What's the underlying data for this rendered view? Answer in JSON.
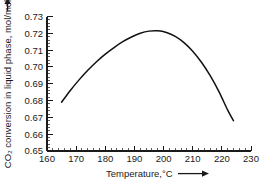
{
  "chart_data": {
    "type": "line",
    "title": "",
    "subtitle": "",
    "xlabel": "Temperature,°C",
    "xlabel_arrow": "⟶",
    "ylabel": "CO₂ conversion in liquid phase, mol/mol",
    "ylabel_arrow": "⟶",
    "xlim": [
      160,
      230
    ],
    "ylim": [
      0.65,
      0.73
    ],
    "xticks": [
      160,
      170,
      180,
      190,
      200,
      210,
      220,
      230
    ],
    "xtick_labels": [
      "160",
      "170",
      "180",
      "190",
      "200",
      "210",
      "220",
      "230"
    ],
    "yticks": [
      0.65,
      0.66,
      0.67,
      0.68,
      0.69,
      0.7,
      0.71,
      0.72,
      0.73
    ],
    "ytick_labels": [
      "0.65",
      "0.66",
      "0.67",
      "0.68",
      "0.69",
      "0.70",
      "0.71",
      "0.72",
      "0.73"
    ],
    "x_minor_per_major": 5,
    "y_minor_per_major": 5,
    "grid": false,
    "legend": false,
    "legend_position": "none",
    "tick_direction": "in",
    "spines": [
      "left",
      "bottom"
    ],
    "line_color": "#111111",
    "background_color": "#ffffff",
    "series": [
      {
        "name": "CO2 conversion",
        "x": [
          165,
          168,
          171,
          174,
          177,
          180,
          183,
          186,
          189,
          192,
          195,
          198,
          201,
          204,
          207,
          210,
          213,
          216,
          219,
          222,
          224
        ],
        "values": [
          0.679,
          0.686,
          0.6923,
          0.698,
          0.7031,
          0.7076,
          0.7115,
          0.715,
          0.7178,
          0.72,
          0.7213,
          0.7215,
          0.7205,
          0.7182,
          0.7145,
          0.7094,
          0.7028,
          0.6948,
          0.6853,
          0.6743,
          0.668
        ]
      }
    ],
    "annotations": {
      "peak_temperature_c": 198,
      "peak_conversion": 0.7215,
      "left_endpoint": [
        165,
        0.679
      ],
      "right_endpoint": [
        224,
        0.668
      ]
    }
  }
}
